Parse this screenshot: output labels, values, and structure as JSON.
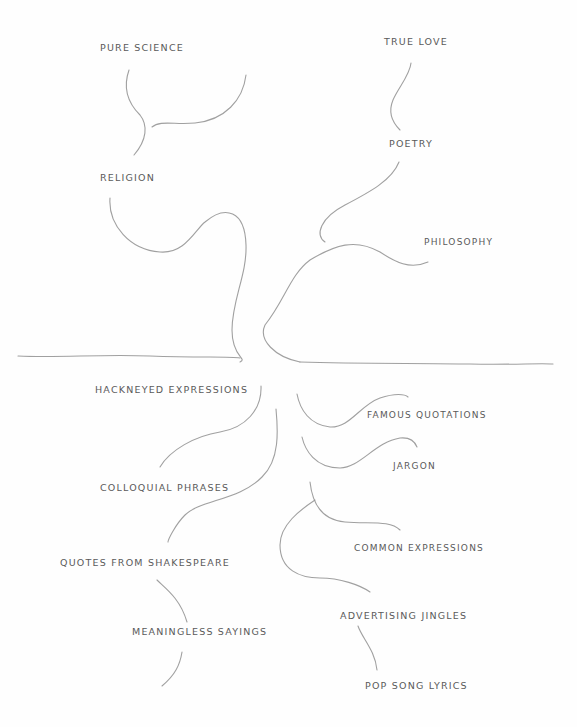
{
  "diagram": {
    "type": "hand-drawn tree / iceberg sketch",
    "waterline_color": "#9a9a9a",
    "above_line": {
      "labels": [
        {
          "id": "pure-science",
          "text": "PURE  SCIENCE"
        },
        {
          "id": "true-love",
          "text": "TRUE LOVE"
        },
        {
          "id": "poetry",
          "text": "POETRY"
        },
        {
          "id": "religion",
          "text": "RELIGION"
        },
        {
          "id": "philosophy",
          "text": "PHILOSOPHY"
        }
      ]
    },
    "below_line": {
      "labels": [
        {
          "id": "hackneyed-expressions",
          "text": "HACKNEYED  EXPRESSIONS"
        },
        {
          "id": "famous-quotations",
          "text": "FAMOUS  QUOTATIONS"
        },
        {
          "id": "jargon",
          "text": "JARGON"
        },
        {
          "id": "colloquial-phrases",
          "text": "COLLOQUIAL  PHRASES"
        },
        {
          "id": "common-expressions",
          "text": "COMMON  EXPRESSIONS"
        },
        {
          "id": "quotes-from-shakespeare",
          "text": "QUOTES  FROM  SHAKESPEARE"
        },
        {
          "id": "advertising-jingles",
          "text": "ADVERTISING  JINGLES"
        },
        {
          "id": "meaningless-sayings",
          "text": "MEANINGLESS   SAYINGS"
        },
        {
          "id": "pop-song-lyrics",
          "text": "POP  SONG  LYRICS"
        }
      ]
    }
  }
}
